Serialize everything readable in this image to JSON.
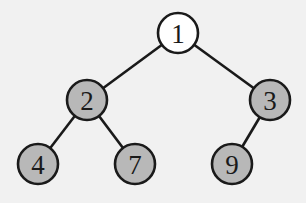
{
  "diagram": {
    "type": "binary-tree",
    "colors": {
      "background": "#f1f1f1",
      "root_fill": "#ffffff",
      "child_fill": "#b8b8b8",
      "stroke": "#1a1a1a"
    },
    "nodes": [
      {
        "id": "n1",
        "label": "1",
        "x": 178,
        "y": 33,
        "fill": "#ffffff"
      },
      {
        "id": "n2",
        "label": "2",
        "x": 87,
        "y": 100,
        "fill": "#b8b8b8"
      },
      {
        "id": "n3",
        "label": "3",
        "x": 270,
        "y": 100,
        "fill": "#b8b8b8"
      },
      {
        "id": "n4",
        "label": "4",
        "x": 38,
        "y": 164,
        "fill": "#b8b8b8"
      },
      {
        "id": "n7",
        "label": "7",
        "x": 135,
        "y": 164,
        "fill": "#b8b8b8"
      },
      {
        "id": "n9",
        "label": "9",
        "x": 232,
        "y": 164,
        "fill": "#b8b8b8"
      }
    ],
    "edges": [
      {
        "from": "n1",
        "to": "n2"
      },
      {
        "from": "n1",
        "to": "n3"
      },
      {
        "from": "n2",
        "to": "n4"
      },
      {
        "from": "n2",
        "to": "n7"
      },
      {
        "from": "n3",
        "to": "n9"
      }
    ],
    "node_radius": 20
  }
}
